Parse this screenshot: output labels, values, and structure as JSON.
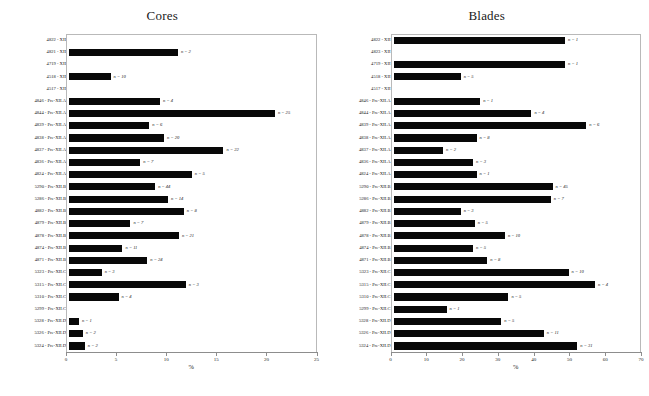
{
  "chart_data": [
    {
      "type": "bar",
      "orientation": "horizontal",
      "title": "Cores",
      "xlabel": "%",
      "ylabel": "",
      "xlim": [
        0,
        25
      ],
      "xticks": [
        0,
        5,
        10,
        15,
        20,
        25
      ],
      "grid": false,
      "legend": null,
      "bar_color": "#080808",
      "categories": [
        "4822 - XII",
        "4821 - XII",
        "4719 - XII",
        "4518 - XII",
        "4517 - XII",
        "4846 - Pre-XII.A",
        "4844 - Pre-XII.A",
        "4839 - Pre-XII.A",
        "4838 - Pre-XII.A",
        "4837 - Pre-XII.A",
        "4836 - Pre-XII.A",
        "4824 - Pre-XII.A",
        "5290 - Pre-XII.B",
        "5286 - Pre-XII.B",
        "4882 - Pre-XII.B",
        "4879 - Pre-XII.B",
        "4878 - Pre-XII.B",
        "4874 - Pre-XII.B",
        "4871 - Pre-XII.B",
        "5323 - Pre-XII.C",
        "5315 - Pre-XII.C",
        "5310 - Pre-XII.C",
        "5299 - Pre-XII.C",
        "5328 - Pre-XII.D",
        "5326 - Pre-XII.D",
        "5324 - Pre-XII.D"
      ],
      "values": [
        0,
        11.0,
        0,
        4.2,
        0,
        9.2,
        20.8,
        8.1,
        9.6,
        15.6,
        7.2,
        12.4,
        8.7,
        10.0,
        11.6,
        6.2,
        11.1,
        5.4,
        7.9,
        3.3,
        11.8,
        5.0,
        0,
        1.0,
        1.4,
        1.6
      ],
      "annotations": [
        "",
        "n = 2",
        "",
        "n = 10",
        "",
        "n = 4",
        "n = 25",
        "n = 6",
        "n = 20",
        "n = 22",
        "n = 7",
        "n = 5",
        "n = 44",
        "n = 14",
        "n = 8",
        "n = 7",
        "n = 21",
        "n = 11",
        "n = 24",
        "n = 3",
        "n = 3",
        "n = 4",
        "",
        "n = 1",
        "n = 2",
        "n = 2"
      ]
    },
    {
      "type": "bar",
      "orientation": "horizontal",
      "title": "Blades",
      "xlabel": "%",
      "ylabel": "",
      "xlim": [
        0,
        70
      ],
      "xticks": [
        0,
        10,
        20,
        30,
        40,
        50,
        60,
        70
      ],
      "grid": false,
      "legend": null,
      "bar_color": "#080808",
      "categories": [
        "4822 - XII",
        "4823 - XII",
        "4719 - XII",
        "4518 - XII",
        "4517 - XII",
        "4846 - Pre-XII.A",
        "4844 - Pre-XII.A",
        "4839 - Pre-XII.A",
        "4838 - Pre-XII.A",
        "4837 - Pre-XII.A",
        "4836 - Pre-XII.A",
        "4824 - Pre-XII.A",
        "5290 - Pre-XII.B",
        "5286 - Pre-XII.B",
        "4882 - Pre-XII.B",
        "4879 - Pre-XII.B",
        "4878 - Pre-XII.B",
        "4874 - Pre-XII.B",
        "4871 - Pre-XII.B",
        "5323 - Pre-XII.C",
        "5315 - Pre-XII.C",
        "5310 - Pre-XII.C",
        "5299 - Pre-XII.C",
        "5328 - Pre-XII.D",
        "5326 - Pre-XII.D",
        "5324 - Pre-XII.D"
      ],
      "values": [
        48.5,
        0,
        48.5,
        19.0,
        0,
        24.5,
        39.0,
        54.5,
        23.5,
        14.0,
        22.5,
        23.5,
        45.0,
        44.5,
        19.0,
        23.0,
        31.5,
        22.5,
        26.5,
        49.5,
        57.0,
        32.5,
        15.0,
        30.5,
        42.5,
        52.0
      ],
      "annotations": [
        "n = 1",
        "",
        "n = 1",
        "n = 5",
        "",
        "n = 1",
        "n = 4",
        "n = 6",
        "n = 8",
        "n = 2",
        "n = 3",
        "n = 1",
        "n = 45",
        "n = 7",
        "n = 3",
        "n = 5",
        "n = 10",
        "n = 5",
        "n = 8",
        "n = 10",
        "n = 4",
        "n = 5",
        "n = 1",
        "n = 5",
        "n = 11",
        "n = 31"
      ]
    }
  ]
}
